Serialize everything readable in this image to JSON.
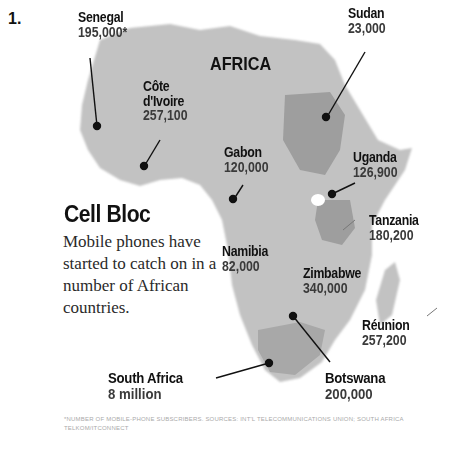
{
  "figure_number": "1.",
  "map_title": "AFRICA",
  "headline": "Cell Bloc",
  "description": "Mobile phones have started to catch on in a number of African countries.",
  "footnote": "*NUMBER OF MOBILE-PHONE SUBSCRIBERS. SOURCES: INT'L TELECOMMUNICATIONS UNION; SOUTH AFRICA TELKOM/ITCONNECT",
  "colors": {
    "land": "#bdbdbd",
    "highlight": "#9a9a9a",
    "text": "#111111"
  },
  "countries": [
    {
      "name": "Senegal",
      "value": "195,000*"
    },
    {
      "name": "Côte d'Ivoire",
      "value": "257,100"
    },
    {
      "name": "Sudan",
      "value": "23,000"
    },
    {
      "name": "Gabon",
      "value": "120,000"
    },
    {
      "name": "Uganda",
      "value": "126,900"
    },
    {
      "name": "Tanzania",
      "value": "180,200"
    },
    {
      "name": "Namibia",
      "value": "82,000"
    },
    {
      "name": "Zimbabwe",
      "value": "340,000"
    },
    {
      "name": "Réunion",
      "value": "257,200"
    },
    {
      "name": "South Africa",
      "value": "8 million"
    },
    {
      "name": "Botswana",
      "value": "200,000"
    }
  ]
}
